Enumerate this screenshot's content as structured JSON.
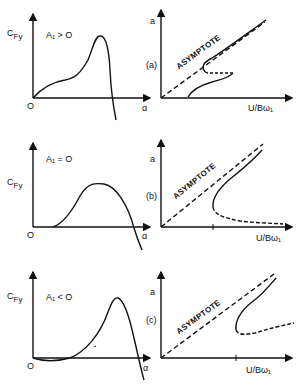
{
  "panels": [
    {
      "id": "a",
      "left": {
        "ylabel": "C",
        "ylabel_sub": "Fy",
        "condition": "A₁ > O",
        "origin": "O",
        "xlabel": "α"
      },
      "right": {
        "ylabel": "a",
        "tag": "(a)",
        "asymptote": "ASYMPTOTE",
        "xlabel": "U/Bω₁"
      }
    },
    {
      "id": "b",
      "left": {
        "ylabel": "C",
        "ylabel_sub": "Fy",
        "condition": "A₁ = O",
        "origin": "O",
        "xlabel": "α"
      },
      "right": {
        "ylabel": "a",
        "tag": "(b)",
        "asymptote": "ASYMPTOTE",
        "xlabel": "U/Bω₁"
      }
    },
    {
      "id": "c",
      "left": {
        "ylabel": "C",
        "ylabel_sub": "Fy",
        "condition": "A₁ < O",
        "origin": "O",
        "xlabel": "α"
      },
      "right": {
        "ylabel": "a",
        "tag": "(c)",
        "asymptote": "ASYMPTOTE",
        "xlabel": "U/Bω₁"
      }
    }
  ]
}
